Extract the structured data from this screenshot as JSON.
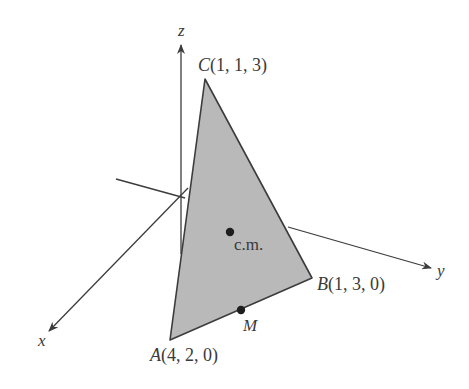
{
  "diagram": {
    "type": "3d-coordinate-triangle",
    "axes": {
      "x": {
        "label": "x"
      },
      "y": {
        "label": "y"
      },
      "z": {
        "label": "z"
      }
    },
    "vertices": [
      {
        "name": "A",
        "coords": "(4, 2, 0)"
      },
      {
        "name": "B",
        "coords": "(1, 3, 0)"
      },
      {
        "name": "C",
        "coords": "(1, 1, 3)"
      }
    ],
    "points": [
      {
        "name": "c.m.",
        "description": "center of mass"
      },
      {
        "name": "M",
        "description": "point on edge AB"
      }
    ],
    "colors": {
      "triangle_fill": "#b9b9b9",
      "stroke": "#3c3c3c",
      "background": "#ffffff"
    }
  }
}
